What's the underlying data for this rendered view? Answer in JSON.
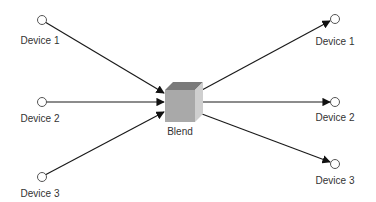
{
  "diagram": {
    "hub": {
      "label": "Blend"
    },
    "inputs": [
      {
        "label": "Device 1"
      },
      {
        "label": "Device 2"
      },
      {
        "label": "Device 3"
      }
    ],
    "outputs": [
      {
        "label": "Device 1"
      },
      {
        "label": "Device 2"
      },
      {
        "label": "Device 3"
      }
    ],
    "colors": {
      "line": "#1a1a1a",
      "node_stroke": "#555555",
      "cube_front": "#a9a9a9",
      "cube_top": "#7a7a7a",
      "cube_side": "#cfcfcf"
    }
  }
}
